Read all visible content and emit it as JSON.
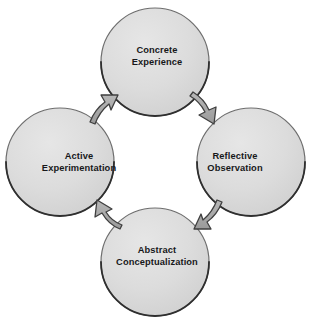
{
  "diagram": {
    "direction": "clockwise",
    "nodes": [
      {
        "id": "concrete-experience",
        "position": "top",
        "line1": "Concrete",
        "line2": "Experience",
        "center_x": 155,
        "center_y": 62,
        "radius": 54
      },
      {
        "id": "reflective-observation",
        "position": "right",
        "line1": "Reflective",
        "line2": "Observation",
        "center_x": 251,
        "center_y": 162,
        "radius": 54
      },
      {
        "id": "abstract-conceptualization",
        "position": "bottom",
        "line1": "Abstract",
        "line2": "Conceptualization",
        "center_x": 155,
        "center_y": 262,
        "radius": 54
      },
      {
        "id": "active-experimentation",
        "position": "left",
        "line1": "Active",
        "line2": "Experimentation",
        "center_x": 60,
        "center_y": 162,
        "radius": 54
      }
    ],
    "arrows": [
      {
        "id": "arrow-concrete-to-reflective",
        "from": "concrete-experience",
        "to": "reflective-observation"
      },
      {
        "id": "arrow-reflective-to-abstract",
        "from": "reflective-observation",
        "to": "abstract-conceptualization"
      },
      {
        "id": "arrow-abstract-to-active",
        "from": "abstract-conceptualization",
        "to": "active-experimentation"
      },
      {
        "id": "arrow-active-to-concrete",
        "from": "active-experimentation",
        "to": "concrete-experience"
      }
    ],
    "divider": {
      "x1": 58,
      "x2": 262,
      "y": 317
    },
    "colors": {
      "circle_fill": "#d9d9d9",
      "circle_fill_light": "#e4e4e4",
      "circle_edge_dark": "#3a3a3a",
      "circle_edge_light": "#b4b4b4",
      "arrow_fill": "#a6a6a6",
      "arrow_edge": "#3f3f3f",
      "text": "#17181a",
      "divider": "#d6d6d8",
      "background": "#ffffff"
    }
  }
}
